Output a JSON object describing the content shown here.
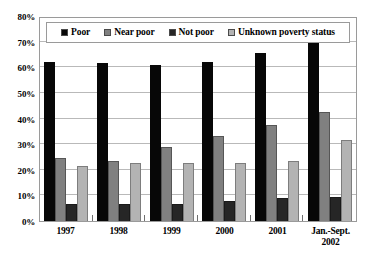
{
  "chart_data": {
    "type": "bar",
    "title": "",
    "subtitle": "",
    "xlabel": "",
    "ylabel": "",
    "categories": [
      "1997",
      "1998",
      "1999",
      "2000",
      "2001",
      "Jan.-Sept. 2002"
    ],
    "category_labels": [
      {
        "line1": "1997",
        "line2": ""
      },
      {
        "line1": "1998",
        "line2": ""
      },
      {
        "line1": "1999",
        "line2": ""
      },
      {
        "line1": "2000",
        "line2": ""
      },
      {
        "line1": "2001",
        "line2": ""
      },
      {
        "line1": "Jan.-Sept.",
        "line2": "2002"
      }
    ],
    "series": [
      {
        "name": "Poor",
        "color": "#070707",
        "values": [
          62,
          61.5,
          61,
          62,
          65.5,
          70
        ]
      },
      {
        "name": "Near poor",
        "color": "#808080",
        "values": [
          24.5,
          23.5,
          29,
          33,
          37.5,
          42.5
        ]
      },
      {
        "name": "Not poor",
        "color": "#262626",
        "values": [
          6.5,
          6.5,
          6.5,
          8,
          9,
          9.5
        ]
      },
      {
        "name": "Unknown poverty status",
        "color": "#b3b3b3",
        "values": [
          21.5,
          22.5,
          22.5,
          22.5,
          23.5,
          31.5
        ]
      }
    ],
    "ylim": [
      0,
      80
    ],
    "ytick_values": [
      0,
      10,
      20,
      30,
      40,
      50,
      60,
      70,
      80
    ],
    "ytick_labels": [
      "0%",
      "10%",
      "20%",
      "30%",
      "40%",
      "50%",
      "60%",
      "70%",
      "80%"
    ],
    "grid": true,
    "grid_axis": "y",
    "legend_position": "top-inside",
    "units": "percent",
    "plot_border_color": "#9a9a9a",
    "gridline_color": "#b9b9b9",
    "background_color": "#ffffff"
  },
  "legend": {
    "items": [
      {
        "label": "Poor",
        "swatch": "legend-swatch-poor",
        "color": "#070707"
      },
      {
        "label": "Near poor",
        "swatch": "legend-swatch-near-poor",
        "color": "#808080"
      },
      {
        "label": "Not poor",
        "swatch": "legend-swatch-not-poor",
        "color": "#262626"
      },
      {
        "label": "Unknown poverty status",
        "swatch": "legend-swatch-unknown",
        "color": "#b3b3b3"
      }
    ]
  }
}
